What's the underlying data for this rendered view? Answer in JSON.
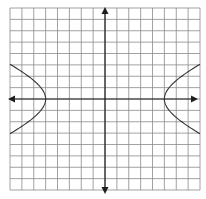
{
  "chart_data": {
    "type": "line",
    "title": "",
    "xlabel": "",
    "ylabel": "",
    "grid": true,
    "grid_cells": {
      "columns": 16,
      "rows": 16
    },
    "xlim": [
      -8,
      8
    ],
    "ylim": [
      -8,
      8
    ],
    "equation": "x^2/25 - y^2/6 = 1",
    "center": [
      0,
      0
    ],
    "vertices": [
      [
        -5,
        0
      ],
      [
        5,
        0
      ]
    ],
    "series": [
      {
        "name": "left-branch",
        "points": [
          [
            -8,
            3
          ],
          [
            -7,
            2.4
          ],
          [
            -6,
            1.6
          ],
          [
            -5.5,
            1.0
          ],
          [
            -5,
            0
          ],
          [
            -5.5,
            -1.0
          ],
          [
            -6,
            -1.6
          ],
          [
            -7,
            -2.4
          ],
          [
            -8,
            -3
          ]
        ]
      },
      {
        "name": "right-branch",
        "points": [
          [
            8,
            3
          ],
          [
            7,
            2.4
          ],
          [
            6,
            1.6
          ],
          [
            5.5,
            1.0
          ],
          [
            5,
            0
          ],
          [
            5.5,
            -1.0
          ],
          [
            6,
            -1.6
          ],
          [
            7,
            -2.4
          ],
          [
            8,
            -3
          ]
        ]
      }
    ],
    "axes": {
      "x_arrows": true,
      "y_arrows": true,
      "tick_labels": false
    }
  },
  "colors": {
    "background": "#ffffff",
    "grid": "#8a8a8a",
    "axis": "#1e1e1e",
    "curve": "#333333"
  }
}
